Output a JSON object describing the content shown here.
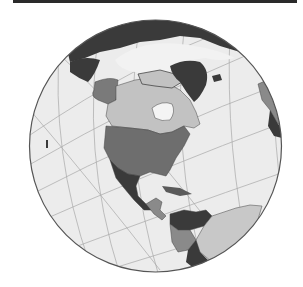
{
  "figure": {
    "type": "orthographic-globe",
    "view_center": "North America",
    "colors": {
      "top_bar": "#2a2a2a",
      "ocean": "#ececec",
      "graticule": "#a8a8a8",
      "outline": "#555555",
      "usa": "#6e6e6e",
      "canada": "#c2c2c2",
      "dark_land": "#3a3a3a",
      "mid_land": "#8a8a8a",
      "light_land": "#c8c8c8",
      "ice": "#f4f4f4"
    }
  }
}
